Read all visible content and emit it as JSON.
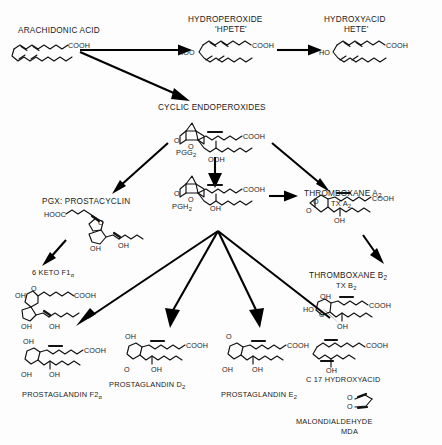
{
  "diagram": {
    "background_color": "#fdfdfd",
    "ink_color": "#111111"
  },
  "nodes": [
    {
      "id": "arachidonic-acid",
      "label": "ARACHIDONIC ACID",
      "sublabel": "",
      "atoms": [
        "COOH"
      ],
      "x": 18,
      "y": 27
    },
    {
      "id": "hpete",
      "label": "HYDROPEROXIDE",
      "sublabel": "'HPETE'",
      "atoms": [
        "COOH",
        "HOO"
      ],
      "x": 188,
      "y": 16
    },
    {
      "id": "hete",
      "label": "HYDROXYACID",
      "sublabel": "HETE'",
      "atoms": [
        "COOH",
        "HO"
      ],
      "x": 318,
      "y": 16
    },
    {
      "id": "cyclic-endoperoxides",
      "label": "CYCLIC ENDOPEROXIDES",
      "sublabel": "",
      "atoms": [
        "COOH",
        "OOH",
        "O",
        "O"
      ],
      "x": 158,
      "y": 104
    },
    {
      "id": "pgg2",
      "label": "PGG",
      "sublabel": "2",
      "atoms": [],
      "x": 176,
      "y": 149
    },
    {
      "id": "pgh2",
      "label": "PGH",
      "sublabel": "2",
      "atoms": [
        "COOH",
        "OH",
        "O",
        "O"
      ],
      "x": 172,
      "y": 203
    },
    {
      "id": "prostacyclin",
      "label": "PGX: PROSTACYCLIN",
      "sublabel": "",
      "atoms": [
        "HOOC",
        "O",
        "OH",
        "OH"
      ],
      "x": 42,
      "y": 198
    },
    {
      "id": "thromboxane-a2",
      "label": "THROMBOXANE A",
      "sublabel": "2",
      "label2": "TX A",
      "sublabel2": "2",
      "atoms": [
        "COOH",
        "OH",
        "O",
        "O"
      ],
      "x": 304,
      "y": 190
    },
    {
      "id": "six-keto-f1a",
      "label": "6 KETO F1",
      "sublabel": "α",
      "atoms": [
        "COOH",
        "O",
        "OH",
        "OH",
        "OH"
      ],
      "x": 32,
      "y": 269
    },
    {
      "id": "thromboxane-b2",
      "label": "THROMBOXANE B",
      "sublabel": "2",
      "label2": "TX B",
      "sublabel2": "2",
      "atoms": [
        "COOH",
        "OH",
        "OH",
        "HO",
        "O"
      ],
      "x": 309,
      "y": 272
    },
    {
      "id": "prostaglandin-f2a",
      "label": "PROSTAGLANDIN F2",
      "sublabel": "α",
      "atoms": [
        "COOH",
        "OH",
        "OH",
        "OH"
      ],
      "x": 22,
      "y": 391
    },
    {
      "id": "prostaglandin-d2",
      "label": "PROSTAGLANDIN D",
      "sublabel": "2",
      "atoms": [
        "COOH",
        "OH",
        "OH",
        "O"
      ],
      "x": 109,
      "y": 381
    },
    {
      "id": "prostaglandin-e2",
      "label": "PROSTAGLANDIN E",
      "sublabel": "2",
      "atoms": [
        "COOH",
        "OH",
        "OH",
        "O"
      ],
      "x": 221,
      "y": 391
    },
    {
      "id": "c17-hydroxyacid",
      "label": "C 17 HYDROXYACID",
      "sublabel": "",
      "atoms": [
        "COOH",
        "OH"
      ],
      "x": 306,
      "y": 376
    },
    {
      "id": "malondialdehyde",
      "label": "MALONDIALDEHYDE",
      "sublabel": "MDA",
      "atoms": [
        "O",
        "O"
      ],
      "x": 296,
      "y": 418
    }
  ],
  "edges": [
    {
      "from": "arachidonic-acid",
      "to": "hpete"
    },
    {
      "from": "hpete",
      "to": "hete"
    },
    {
      "from": "arachidonic-acid",
      "to": "cyclic-endoperoxides"
    },
    {
      "from": "cyclic-endoperoxides",
      "to": "prostacyclin"
    },
    {
      "from": "pgg2",
      "to": "pgh2"
    },
    {
      "from": "cyclic-endoperoxides",
      "to": "thromboxane-a2"
    },
    {
      "from": "pgh2",
      "to": "thromboxane-a2"
    },
    {
      "from": "prostacyclin",
      "to": "six-keto-f1a"
    },
    {
      "from": "thromboxane-a2",
      "to": "thromboxane-b2"
    },
    {
      "from": "pgh2",
      "to": "prostaglandin-f2a"
    },
    {
      "from": "pgh2",
      "to": "prostaglandin-d2"
    },
    {
      "from": "pgh2",
      "to": "prostaglandin-e2"
    },
    {
      "from": "pgh2",
      "to": "c17-hydroxyacid"
    }
  ]
}
